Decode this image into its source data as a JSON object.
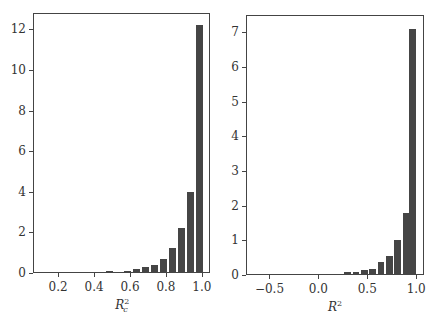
{
  "chart_data": [
    {
      "type": "bar",
      "title": "",
      "xlabel": "R_c^2",
      "ylabel": "",
      "xlim": [
        0.06,
        1.045
      ],
      "ylim": [
        0,
        12.8
      ],
      "xticks": [
        0.2,
        0.4,
        0.6,
        0.8,
        1.0
      ],
      "xtick_labels": [
        "0.2",
        "0.4",
        "0.6",
        "0.8",
        "1.0"
      ],
      "yticks": [
        0,
        2,
        4,
        6,
        8,
        10,
        12
      ],
      "ytick_labels": [
        "0",
        "2",
        "4",
        "6",
        "8",
        "10",
        "12"
      ],
      "bin_width": 0.05,
      "x": [
        0.385,
        0.435,
        0.485,
        0.535,
        0.585,
        0.635,
        0.685,
        0.735,
        0.785,
        0.835,
        0.885,
        0.935,
        0.985
      ],
      "values": [
        0.03,
        0.04,
        0.08,
        0.05,
        0.08,
        0.2,
        0.28,
        0.38,
        0.7,
        1.25,
        2.2,
        4.0,
        12.2
      ],
      "grid": false,
      "legend": null
    },
    {
      "type": "bar",
      "title": "",
      "xlabel": "R^2",
      "ylabel": "",
      "xlim": [
        -0.74,
        1.08
      ],
      "ylim": [
        0,
        7.5
      ],
      "xticks": [
        -0.5,
        0.0,
        0.5,
        1.0
      ],
      "xtick_labels": [
        "−0.5",
        "0.0",
        "0.5",
        "1.0"
      ],
      "yticks": [
        0,
        1,
        2,
        3,
        4,
        5,
        6,
        7
      ],
      "ytick_labels": [
        "0",
        "1",
        "2",
        "3",
        "4",
        "5",
        "6",
        "7"
      ],
      "bin_width": 0.085,
      "x": [
        -0.04,
        0.045,
        0.13,
        0.215,
        0.3,
        0.385,
        0.47,
        0.555,
        0.64,
        0.725,
        0.81,
        0.895,
        0.96
      ],
      "values": [
        0.02,
        0.02,
        0.02,
        0.02,
        0.08,
        0.08,
        0.15,
        0.18,
        0.38,
        0.55,
        1.0,
        1.8,
        7.1
      ],
      "grid": false,
      "legend": null
    }
  ],
  "panels": [
    {
      "xlabel_base": "R",
      "xlabel_sup": "2",
      "xlabel_sub": "c"
    },
    {
      "xlabel_base": "R",
      "xlabel_sup": "2",
      "xlabel_sub": ""
    }
  ]
}
